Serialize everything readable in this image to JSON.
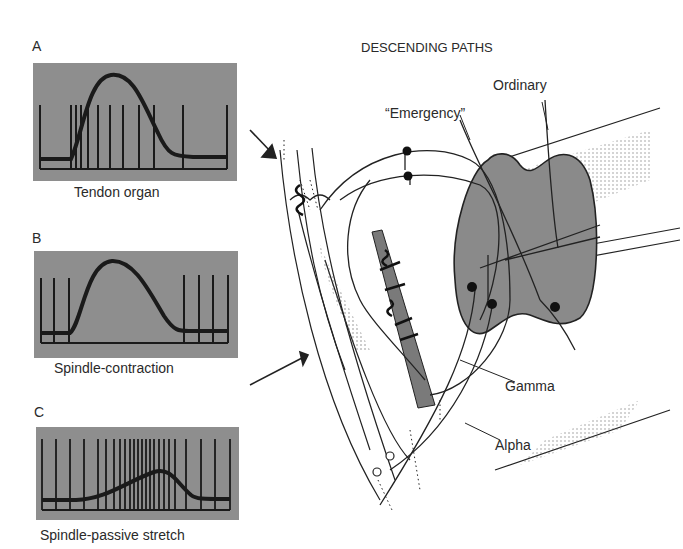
{
  "panels": [
    {
      "letter": "A",
      "caption": "Tendon organ"
    },
    {
      "letter": "B",
      "caption": "Spindle-contraction"
    },
    {
      "letter": "C",
      "caption": "Spindle-passive stretch"
    }
  ],
  "diagram": {
    "title": "DESCENDING PATHS",
    "labels": {
      "ordinary": "Ordinary",
      "emergency": "“Emergency”",
      "gamma": "Gamma",
      "alpha": "Alpha"
    }
  },
  "colors": {
    "panel_bg": "#8e8e8e",
    "trace": "#1a1a1a",
    "cord": "#8a8a8a",
    "line": "#222222"
  }
}
